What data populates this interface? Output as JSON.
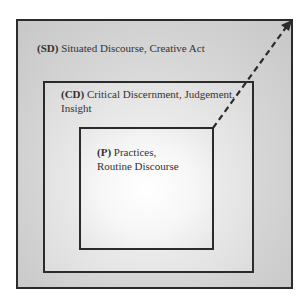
{
  "diagram": {
    "type": "nested-boxes",
    "levels": [
      {
        "id": "SD",
        "code": "(SD)",
        "text": "Situated Discourse, Creative Act",
        "line2": ""
      },
      {
        "id": "CD",
        "code": "(CD)",
        "text": "Critical Discernment, Judgement,",
        "line2": "Insight"
      },
      {
        "id": "P",
        "code": "(P)",
        "text": "Practices,",
        "line2": "Routine Discourse"
      }
    ],
    "arrow": {
      "style": "dashed",
      "from": "P top-right corner",
      "to": "SD top-right corner"
    },
    "colors": {
      "border": "#2b2b2b",
      "outer_fill": "#d6d6d6",
      "middle_fill": "#e6e6e6",
      "inner_fill": "#ffffff",
      "text": "#333333"
    }
  }
}
